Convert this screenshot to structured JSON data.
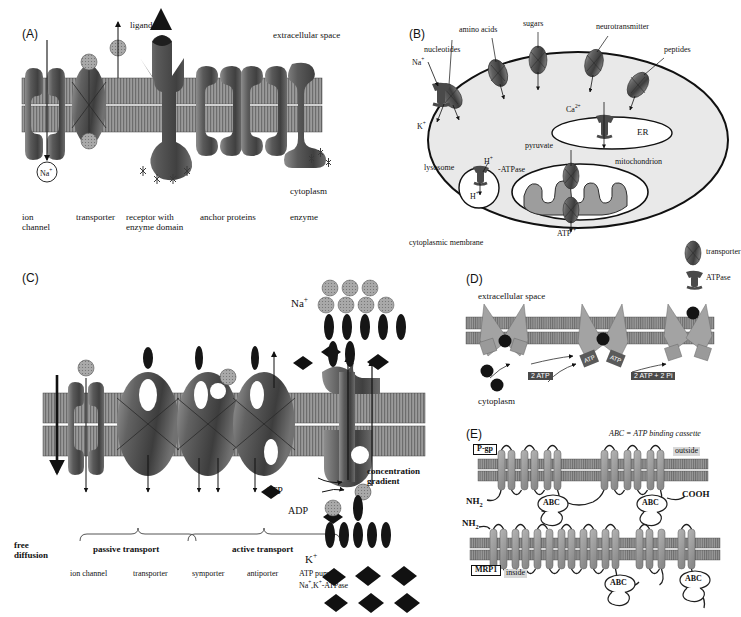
{
  "panelA": {
    "id": "(A)",
    "top_label": "extracellular space",
    "bottom_label": "cytoplasm",
    "ligand": "ligand",
    "ion": "Na",
    "ion_charge": "+",
    "items": [
      {
        "line1": "ion",
        "line2": "channel"
      },
      {
        "line1": "transporter",
        "line2": ""
      },
      {
        "line1": "receptor with",
        "line2": "enzyme domain"
      },
      {
        "line1": "anchor proteins",
        "line2": ""
      },
      {
        "line1": "enzyme",
        "line2": ""
      }
    ]
  },
  "panelB": {
    "id": "(B)",
    "membrane_label": "cytoplasmic membrane",
    "surface_transporters": [
      "nucleotides",
      "amino acids",
      "sugars",
      "neurotransmitter",
      "peptides"
    ],
    "pump_na": "Na",
    "pump_k": "K",
    "charge": "+",
    "lysosome": "lysosome",
    "lysosome_h_out": "H",
    "lysosome_h_in": "H",
    "atpase_label": "-ATPase",
    "er_label": "ER",
    "er_ion": "Ca",
    "er_ion_charge": "2+",
    "mitochondrion": "mitochondrion",
    "pyruvate": "pyruvate",
    "atp": "ATP",
    "legend": [
      {
        "icon": "transporter-glyph",
        "label": "transporter"
      },
      {
        "icon": "atpase-glyph",
        "label": "ATPase"
      }
    ]
  },
  "panelC": {
    "id": "(C)",
    "free_diffusion": {
      "line1": "free",
      "line2": "diffusion"
    },
    "brace_passive": "passive transport",
    "brace_active": "active transport",
    "mechanisms": [
      {
        "line1": "ion channel",
        "line2": ""
      },
      {
        "line1": "transporter",
        "line2": ""
      },
      {
        "line1": "symporter",
        "line2": ""
      },
      {
        "line1": "antiporter",
        "line2": ""
      },
      {
        "line1": "ATP pump",
        "line2": "Na+,K+-ATPase"
      }
    ],
    "atp": "ATP",
    "adp": "ADP",
    "sodium": "Na",
    "potassium": "K",
    "charge": "+",
    "gradient": {
      "line1": "concentration",
      "line2": "gradient"
    }
  },
  "panelD": {
    "id": "(D)",
    "top_label": "extracellular space",
    "bottom_label": "cytoplasm",
    "atp_in": "2 ATP",
    "atp_out": "2 ATP + 2 Pi",
    "atp_site": "ATP"
  },
  "panelE": {
    "id": "(E)",
    "abbreviation": "ABC = ATP binding cassette",
    "protein_top": "P-gp",
    "protein_bottom": "MRP1",
    "outside": "outside",
    "inside": "inside",
    "n_terminus": "NH",
    "n_sub": "2",
    "c_terminus": "COOH",
    "abc_label": "ABC",
    "top_helix_count": 12,
    "bottom_helix_count": 17
  },
  "colors": {
    "membrane": "#8c8c8c",
    "protein_dark": "#4d4d4d",
    "protein_mid": "#6e6e6e",
    "protein_light": "#a8a8a8",
    "black": "#111111",
    "particle_gray": "#9a9a9a"
  }
}
